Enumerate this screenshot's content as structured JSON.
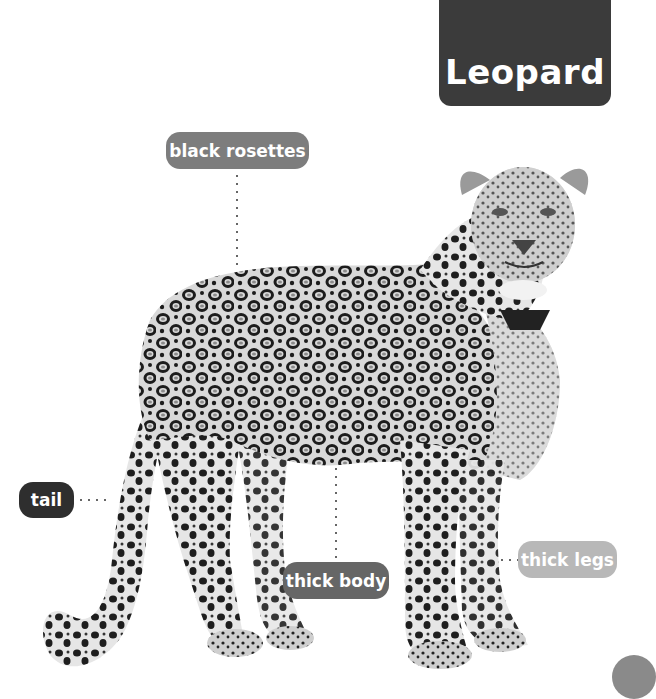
{
  "title": "Leopard",
  "image": {
    "subject": "leopard-photo",
    "style": "grayscale"
  },
  "labels": [
    {
      "id": "black-rosettes",
      "text": "black rosettes"
    },
    {
      "id": "tail",
      "text": "tail"
    },
    {
      "id": "thick-body",
      "text": "thick body"
    },
    {
      "id": "thick-legs",
      "text": "thick legs"
    }
  ],
  "colors": {
    "title_bg": "#3b3b3b",
    "label_rosettes": "#7d7d7d",
    "label_tail": "#2e2e2e",
    "label_body": "#666666",
    "label_legs": "#b8b8b8"
  }
}
